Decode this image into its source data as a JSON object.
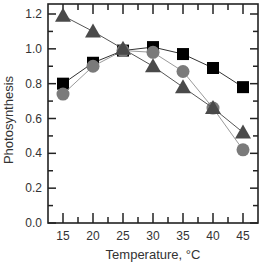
{
  "chart_data": {
    "type": "line",
    "title": "",
    "xlabel": "Temperature, °C",
    "ylabel": "Photosynthesis",
    "xlim": [
      12.5,
      47.5
    ],
    "ylim": [
      0.0,
      1.23
    ],
    "x": [
      15,
      20,
      25,
      30,
      35,
      40,
      45
    ],
    "xticks": [
      15,
      20,
      25,
      30,
      35,
      40,
      45
    ],
    "yticks": [
      0.0,
      0.2,
      0.4,
      0.6,
      0.8,
      1.0,
      1.2
    ],
    "ytick_labels": [
      "0.0",
      "0.2",
      "0.4",
      "0.6",
      "0.8",
      "1.0",
      "1.2"
    ],
    "grid": false,
    "legend": null,
    "series": [
      {
        "name": "squares",
        "marker": "square",
        "color": "#000000",
        "line_color": "#333333",
        "values": [
          0.8,
          0.92,
          0.99,
          1.01,
          0.97,
          0.89,
          0.78
        ]
      },
      {
        "name": "circles",
        "marker": "circle",
        "color": "#7a7a7a",
        "line_color": "#9a9a9a",
        "values": [
          0.74,
          0.9,
          0.99,
          0.98,
          0.87,
          0.66,
          0.42
        ]
      },
      {
        "name": "triangles",
        "marker": "triangle",
        "color": "#4a4a4a",
        "line_color": "#555555",
        "values": [
          1.19,
          1.1,
          1.0,
          0.9,
          0.78,
          0.66,
          0.52
        ]
      }
    ]
  }
}
